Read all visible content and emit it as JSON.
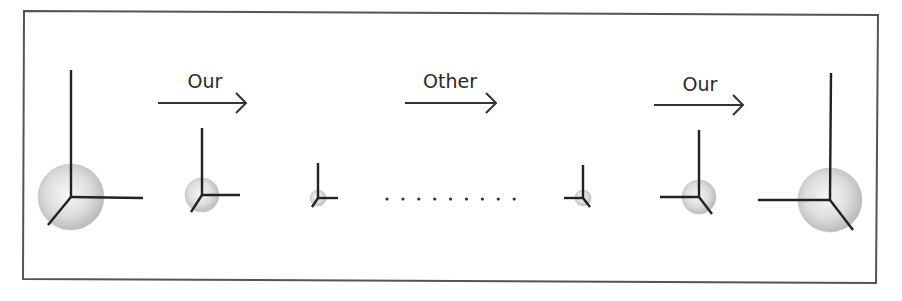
{
  "diagram": {
    "frame": {
      "stroke": "#555555",
      "corners": [
        [
          24,
          11
        ],
        [
          878,
          15
        ],
        [
          876,
          283
        ],
        [
          23,
          279
        ]
      ]
    },
    "colors": {
      "axis": "#222222",
      "sphere_light": "#f4f4f4",
      "sphere_dark": "#b8b8b8",
      "text": "#2a2a2a"
    },
    "transitions": [
      {
        "label": "Our",
        "text_x": 205,
        "text_top": 72,
        "arrow": {
          "x1": 158,
          "x2": 246,
          "y": 103
        }
      },
      {
        "label": "Other",
        "text_x": 450,
        "text_top": 72,
        "arrow": {
          "x1": 405,
          "x2": 496,
          "y": 103
        }
      },
      {
        "label": "Our",
        "text_x": 700,
        "text_top": 75,
        "arrow": {
          "x1": 654,
          "x2": 743,
          "y": 105
        }
      }
    ],
    "frames": [
      {
        "name": "frame-1-large",
        "origin": [
          71,
          197
        ],
        "sphere_r": 33,
        "up_end": [
          71,
          70
        ],
        "side_end": [
          143,
          198
        ],
        "diag_end": [
          48,
          225
        ]
      },
      {
        "name": "frame-2-medium",
        "origin": [
          202,
          195
        ],
        "sphere_r": 17,
        "up_end": [
          202,
          128
        ],
        "side_end": [
          240,
          195
        ],
        "diag_end": [
          191,
          212
        ]
      },
      {
        "name": "frame-3-small",
        "origin": [
          318,
          198
        ],
        "sphere_r": 8,
        "up_end": [
          318,
          163
        ],
        "side_end": [
          338,
          198
        ],
        "diag_end": [
          312,
          207
        ]
      },
      {
        "name": "frame-4-small",
        "origin": [
          583,
          198
        ],
        "sphere_r": 8,
        "up_end": [
          583,
          165
        ],
        "side_end": [
          564,
          198
        ],
        "diag_end": [
          590,
          207
        ]
      },
      {
        "name": "frame-5-medium",
        "origin": [
          699,
          197
        ],
        "sphere_r": 17,
        "up_end": [
          699,
          130
        ],
        "side_end": [
          660,
          197
        ],
        "diag_end": [
          712,
          214
        ]
      },
      {
        "name": "frame-6-large",
        "origin": [
          830,
          200
        ],
        "sphere_r": 32,
        "up_end": [
          831,
          73
        ],
        "side_end": [
          758,
          200
        ],
        "diag_end": [
          853,
          230
        ]
      }
    ],
    "ellipsis": {
      "count": 9,
      "start_x": 387,
      "spacing": 15.9,
      "y": 199,
      "r": 1.6
    }
  }
}
